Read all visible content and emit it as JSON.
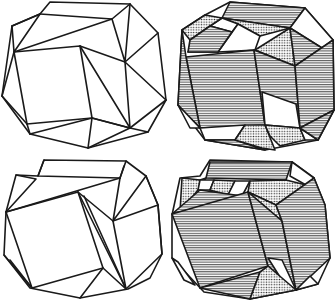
{
  "figure": {
    "panels": [
      {
        "id": "top-left",
        "style": "line-drawing"
      },
      {
        "id": "top-right",
        "style": "shaded",
        "fills": [
          "horizontal-hatch",
          "stipple",
          "white"
        ]
      },
      {
        "id": "bottom-left",
        "style": "line-drawing"
      },
      {
        "id": "bottom-right",
        "style": "shaded",
        "fills": [
          "horizontal-hatch",
          "stipple",
          "white"
        ]
      }
    ],
    "colors": {
      "stroke": "#1a1a1a",
      "background": "#ffffff",
      "fill_blank": "#ffffff"
    }
  }
}
